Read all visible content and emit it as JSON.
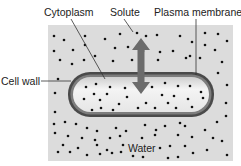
{
  "labels": {
    "cytoplasm": "Cytoplasm",
    "solute": "Solute",
    "plasma_membrane": "Plasma membrane",
    "cell_wall": "Cell wall",
    "water": "Water"
  },
  "colors": {
    "background_field": "#dcdcdc",
    "cell_wall": "#4a4a4a",
    "cytoplasm": "#ececec",
    "arrow": "#6b6b6b",
    "dot": "#111111",
    "leader": "#333333"
  },
  "outside_dots": [
    [
      54,
      36
    ],
    [
      64,
      40
    ],
    [
      85,
      36
    ],
    [
      105,
      39
    ],
    [
      120,
      34
    ],
    [
      137,
      33
    ],
    [
      146,
      36
    ],
    [
      157,
      35
    ],
    [
      180,
      36
    ],
    [
      192,
      42
    ],
    [
      205,
      33
    ],
    [
      218,
      34
    ],
    [
      227,
      41
    ],
    [
      54,
      51
    ],
    [
      73,
      50
    ],
    [
      85,
      45
    ],
    [
      95,
      56
    ],
    [
      115,
      48
    ],
    [
      128,
      47
    ],
    [
      143,
      51
    ],
    [
      160,
      52
    ],
    [
      173,
      51
    ],
    [
      190,
      56
    ],
    [
      205,
      45
    ],
    [
      215,
      50
    ],
    [
      60,
      60
    ],
    [
      72,
      64
    ],
    [
      84,
      60
    ],
    [
      113,
      61
    ],
    [
      132,
      60
    ],
    [
      158,
      60
    ],
    [
      186,
      58
    ],
    [
      200,
      58
    ],
    [
      222,
      62
    ],
    [
      58,
      79
    ],
    [
      218,
      73
    ],
    [
      227,
      85
    ],
    [
      55,
      93
    ],
    [
      226,
      103
    ],
    [
      55,
      112
    ],
    [
      226,
      116
    ],
    [
      54,
      124
    ],
    [
      65,
      122
    ],
    [
      76,
      124
    ],
    [
      87,
      128
    ],
    [
      97,
      131
    ],
    [
      116,
      128
    ],
    [
      126,
      131
    ],
    [
      145,
      125
    ],
    [
      156,
      130
    ],
    [
      165,
      126
    ],
    [
      180,
      123
    ],
    [
      185,
      126
    ],
    [
      205,
      130
    ],
    [
      217,
      122
    ],
    [
      55,
      133
    ],
    [
      68,
      136
    ],
    [
      82,
      138
    ],
    [
      95,
      140
    ],
    [
      110,
      138
    ],
    [
      120,
      136
    ],
    [
      142,
      138
    ],
    [
      155,
      135
    ],
    [
      178,
      135
    ],
    [
      192,
      137
    ],
    [
      213,
      138
    ],
    [
      222,
      141
    ],
    [
      63,
      145
    ],
    [
      78,
      148
    ],
    [
      97,
      145
    ],
    [
      107,
      150
    ],
    [
      123,
      145
    ],
    [
      160,
      148
    ],
    [
      170,
      146
    ],
    [
      185,
      146
    ],
    [
      58,
      152
    ],
    [
      70,
      152
    ],
    [
      87,
      155
    ],
    [
      100,
      154
    ],
    [
      112,
      153
    ],
    [
      121,
      152
    ],
    [
      133,
      156
    ],
    [
      143,
      157
    ],
    [
      168,
      158
    ],
    [
      178,
      157
    ],
    [
      193,
      153
    ],
    [
      207,
      150
    ],
    [
      227,
      155
    ]
  ],
  "inside_dots": [
    [
      86,
      87
    ],
    [
      96,
      84
    ],
    [
      110,
      87
    ],
    [
      125,
      88
    ],
    [
      152,
      87
    ],
    [
      165,
      83
    ],
    [
      178,
      86
    ],
    [
      190,
      86
    ],
    [
      201,
      92
    ],
    [
      94,
      94
    ],
    [
      107,
      94
    ],
    [
      127,
      97
    ],
    [
      162,
      95
    ],
    [
      174,
      96
    ],
    [
      84,
      99
    ],
    [
      100,
      100
    ],
    [
      119,
      104
    ],
    [
      146,
      103
    ],
    [
      168,
      103
    ],
    [
      188,
      99
    ],
    [
      203,
      98
    ],
    [
      92,
      110
    ],
    [
      101,
      108
    ],
    [
      113,
      110
    ],
    [
      138,
      108
    ],
    [
      155,
      108
    ],
    [
      176,
      108
    ],
    [
      192,
      107
    ]
  ]
}
